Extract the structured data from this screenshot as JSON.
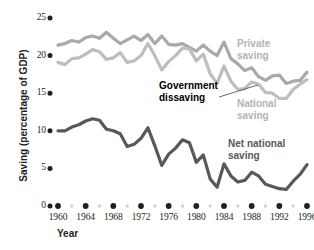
{
  "chart_data": {
    "type": "line",
    "title": "",
    "xlabel": "Year",
    "ylabel": "Saving (percentage of GDP)",
    "xlim": [
      1959,
      1997
    ],
    "ylim": [
      0,
      25
    ],
    "grid": false,
    "legend_position": "inline-annotations",
    "y_ticks": [
      0,
      5,
      10,
      15,
      20,
      25
    ],
    "y_tick_labels": [
      "0",
      "5",
      "10",
      "15",
      "20",
      "25"
    ],
    "x_ticks_major": [
      1960,
      1964,
      1968,
      1972,
      1976,
      1980,
      1984,
      1988,
      1992,
      1996
    ],
    "x_tick_labels": [
      "1960",
      "1964",
      "1968",
      "1972",
      "1976",
      "1980",
      "1984",
      "1988",
      "1992",
      "1996"
    ],
    "x_minor_years": [
      1962,
      1966,
      1970,
      1974,
      1978,
      1982,
      1986,
      1990,
      1994
    ],
    "x": [
      1960,
      1961,
      1962,
      1963,
      1964,
      1965,
      1966,
      1967,
      1968,
      1969,
      1970,
      1971,
      1972,
      1973,
      1974,
      1975,
      1976,
      1977,
      1978,
      1979,
      1980,
      1981,
      1982,
      1983,
      1984,
      1985,
      1986,
      1987,
      1988,
      1989,
      1990,
      1991,
      1992,
      1993,
      1994,
      1995,
      1996
    ],
    "series": [
      {
        "name": "Private saving",
        "color": "#a7a9ac",
        "values": [
          21.4,
          21.6,
          22.0,
          21.8,
          22.4,
          22.6,
          22.3,
          23.1,
          22.3,
          21.6,
          22.1,
          22.6,
          22.0,
          22.8,
          21.6,
          22.6,
          21.5,
          21.4,
          21.6,
          21.1,
          20.6,
          21.4,
          20.6,
          20.0,
          21.8,
          19.6,
          18.9,
          18.0,
          18.4,
          17.2,
          16.7,
          17.3,
          17.4,
          16.3,
          16.6,
          16.7,
          17.8
        ]
      },
      {
        "name": "National saving",
        "color": "#bcbec0",
        "values": [
          19.1,
          18.8,
          19.6,
          19.7,
          20.2,
          20.8,
          20.5,
          19.5,
          19.7,
          20.4,
          19.1,
          19.3,
          20.0,
          21.6,
          20.0,
          18.1,
          19.2,
          20.0,
          21.0,
          20.9,
          19.3,
          20.2,
          17.6,
          16.3,
          18.6,
          16.6,
          15.5,
          15.6,
          16.5,
          16.2,
          15.1,
          15.0,
          14.3,
          14.3,
          15.5,
          16.2,
          16.8
        ]
      },
      {
        "name": "Net national saving",
        "color": "#58585b",
        "values": [
          10.0,
          10.0,
          10.5,
          10.8,
          11.3,
          11.6,
          11.4,
          10.2,
          10.0,
          9.6,
          7.9,
          8.2,
          9.0,
          10.4,
          8.0,
          5.4,
          6.9,
          7.7,
          8.8,
          8.4,
          5.8,
          6.8,
          3.6,
          2.5,
          5.6,
          4.0,
          3.2,
          3.4,
          4.5,
          4.0,
          2.9,
          2.6,
          2.3,
          2.2,
          3.3,
          4.2,
          5.5
        ]
      }
    ],
    "annotations": [
      {
        "name": "private-saving",
        "text": "Private\nsaving",
        "color": "#b3b3b3"
      },
      {
        "name": "national-saving",
        "text": "National\nsaving",
        "color": "#b3b3b3"
      },
      {
        "name": "net-national-saving",
        "text": "Net national\nsaving",
        "color": "#58585b"
      },
      {
        "name": "government-dissaving",
        "text": "Government\ndissaving",
        "color": "#000000",
        "has_leader_line": true
      }
    ],
    "colors": {
      "private": "#a7a9ac",
      "national": "#bcbec0",
      "net_national": "#58585b",
      "tick_major": "#231f20",
      "tick_minor": "#d1d3d4",
      "text": "#231f20",
      "background": "#ffffff"
    }
  }
}
